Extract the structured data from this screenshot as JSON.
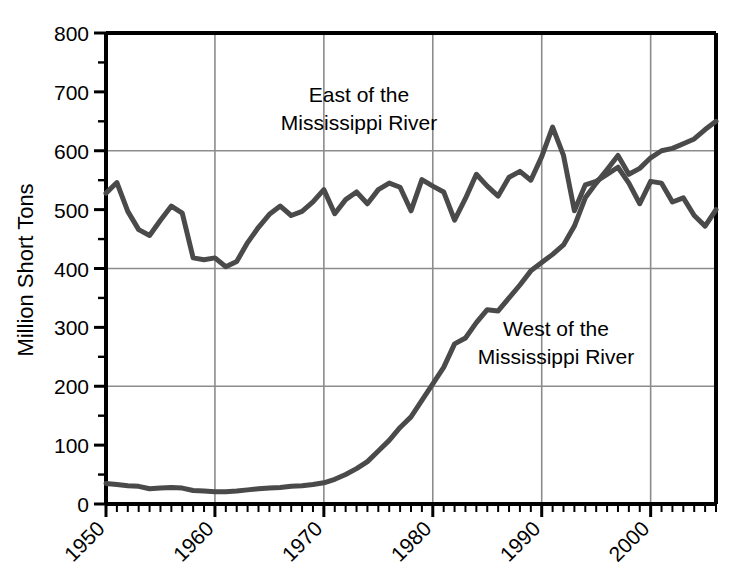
{
  "chart_data": {
    "type": "line",
    "title": "",
    "xlabel": "",
    "ylabel": "Million Short Tons",
    "xlim": [
      1950,
      2006
    ],
    "ylim": [
      0,
      800
    ],
    "yticks": [
      0,
      100,
      200,
      300,
      400,
      500,
      600,
      700,
      800
    ],
    "xticks": [
      1950,
      1960,
      1970,
      1980,
      1990,
      2000
    ],
    "xtick_labels": [
      "1950",
      "1960",
      "1970",
      "1980",
      "1990",
      "2000"
    ],
    "ytick_labels": [
      "0",
      "100",
      "200",
      "300",
      "400",
      "500",
      "600",
      "700",
      "800"
    ],
    "grid": "major horizontal at 200/400/600, vertical at each decade",
    "legend_position": "inline annotations on plot",
    "minor_ticks": "annual ticks on x-axis",
    "line_color": "#4a4a4a",
    "line_width": 5,
    "x": [
      1950,
      1951,
      1952,
      1953,
      1954,
      1955,
      1956,
      1957,
      1958,
      1959,
      1960,
      1961,
      1962,
      1963,
      1964,
      1965,
      1966,
      1967,
      1968,
      1969,
      1970,
      1971,
      1972,
      1973,
      1974,
      1975,
      1976,
      1977,
      1978,
      1979,
      1980,
      1981,
      1982,
      1983,
      1984,
      1985,
      1986,
      1987,
      1988,
      1989,
      1990,
      1991,
      1992,
      1993,
      1994,
      1995,
      1996,
      1997,
      1998,
      1999,
      2000,
      2001,
      2002,
      2003,
      2004,
      2005,
      2006
    ],
    "series": [
      {
        "name": "East of the Mississippi River",
        "annotation": "East of the\nMississippi River",
        "annotation_line1": "East of the",
        "annotation_line2": "Mississippi River",
        "values": [
          528,
          546,
          497,
          466,
          456,
          482,
          506,
          494,
          418,
          415,
          418,
          403,
          412,
          444,
          470,
          492,
          506,
          490,
          497,
          513,
          534,
          493,
          517,
          530,
          510,
          534,
          545,
          538,
          498,
          551,
          540,
          530,
          482,
          519,
          560,
          540,
          523,
          555,
          565,
          550,
          590,
          640,
          592,
          498,
          542,
          548,
          560,
          572,
          545,
          510,
          548,
          545,
          513,
          520,
          490,
          472,
          500
        ]
      },
      {
        "name": "West of the Mississippi River",
        "annotation": "West of the\nMississippi River",
        "annotation_line1": "West of the",
        "annotation_line2": "Mississippi River",
        "values": [
          35,
          33,
          31,
          30,
          26,
          27,
          28,
          27,
          23,
          22,
          21,
          21,
          22,
          24,
          26,
          27,
          28,
          30,
          31,
          33,
          36,
          42,
          50,
          60,
          72,
          90,
          108,
          130,
          148,
          176,
          204,
          232,
          272,
          282,
          308,
          330,
          328,
          350,
          372,
          396,
          410,
          424,
          440,
          472,
          520,
          545,
          568,
          592,
          560,
          570,
          588,
          600,
          604,
          612,
          620,
          636,
          650
        ]
      }
    ]
  },
  "annotations": {
    "east_label_line1": "East of the",
    "east_label_line2": "Mississippi River",
    "west_label_line1": "West of the",
    "west_label_line2": "Mississippi River"
  },
  "axes": {
    "y_title": "Million Short Tons"
  },
  "colors": {
    "line": "#4a4a4a",
    "grid": "#8c8c8c",
    "axis": "#000000",
    "background": "#ffffff"
  }
}
